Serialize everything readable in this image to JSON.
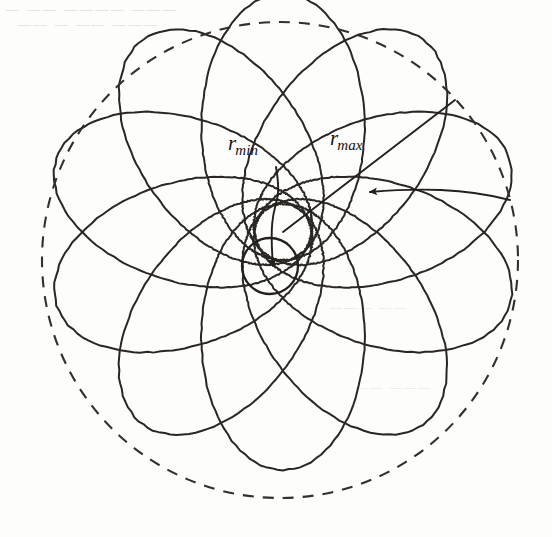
{
  "figure": {
    "kind": "precessing-orbit-rosette-diagram",
    "background_color": "#fdfdfc",
    "ink_color": "#231f1c",
    "width": 552,
    "height": 537,
    "labels": {
      "r_min": {
        "base": "r",
        "subscript": "min"
      },
      "r_max": {
        "base": "r",
        "subscript": "max"
      }
    },
    "scan_artifacts": {
      "line_1": "—   ——  ————  ———",
      "line_2": "——    —   ——  ———",
      "line_3": "———  ——",
      "line_4": "——  ———"
    }
  },
  "chart_data": {
    "type": "line",
    "title": "",
    "subtitle": "",
    "xlabel": "",
    "ylabel": "",
    "grid": false,
    "legend_position": "none",
    "annotations": [
      {
        "name": "r_min",
        "text": "r_min",
        "label_x": 240,
        "label_y": 145,
        "target_x": 273,
        "target_y": 266,
        "leader": "curved-arrow-down"
      },
      {
        "name": "r_max",
        "text": "r_max",
        "label_x": 348,
        "label_y": 142,
        "target_x": 455,
        "target_y": 100,
        "leader": "straight-radius-line"
      },
      {
        "name": "precession-direction",
        "text": "",
        "arrow_from_x": 510,
        "arrow_from_y": 200,
        "arrow_to_x": 370,
        "arrow_to_y": 192,
        "leader": "curved-arrow-left"
      }
    ],
    "geometry": {
      "focus": {
        "x": 283,
        "y": 232
      },
      "outer_dashed_circle": {
        "cx": 280,
        "cy": 260,
        "r": 238,
        "style": "dashed",
        "meaning": "r_max envelope"
      },
      "inner_solid_circle": {
        "cx": 270,
        "cy": 266,
        "r": 28,
        "style": "solid",
        "meaning": "r_min envelope / central body"
      },
      "r_min_over_r_max": 0.118,
      "eccentricity": 0.788,
      "petal_count": 10,
      "precession_per_orbit_deg": 36,
      "orbit_start_angle_deg": 90,
      "precession_sense": "counterclockwise"
    },
    "series": [
      {
        "name": "orbit-petal-1",
        "apsidal_axis_deg": 90,
        "r_min": 28,
        "r_max": 238
      },
      {
        "name": "orbit-petal-2",
        "apsidal_axis_deg": 126,
        "r_min": 28,
        "r_max": 238
      },
      {
        "name": "orbit-petal-3",
        "apsidal_axis_deg": 162,
        "r_min": 28,
        "r_max": 238
      },
      {
        "name": "orbit-petal-4",
        "apsidal_axis_deg": 198,
        "r_min": 28,
        "r_max": 238
      },
      {
        "name": "orbit-petal-5",
        "apsidal_axis_deg": 234,
        "r_min": 28,
        "r_max": 238
      },
      {
        "name": "orbit-petal-6",
        "apsidal_axis_deg": 270,
        "r_min": 28,
        "r_max": 238
      },
      {
        "name": "orbit-petal-7",
        "apsidal_axis_deg": 306,
        "r_min": 28,
        "r_max": 238
      },
      {
        "name": "orbit-petal-8",
        "apsidal_axis_deg": 342,
        "r_min": 28,
        "r_max": 238
      },
      {
        "name": "orbit-petal-9",
        "apsidal_axis_deg": 18,
        "r_min": 28,
        "r_max": 238
      },
      {
        "name": "orbit-petal-10",
        "apsidal_axis_deg": 54,
        "r_min": 28,
        "r_max": 238
      }
    ]
  }
}
